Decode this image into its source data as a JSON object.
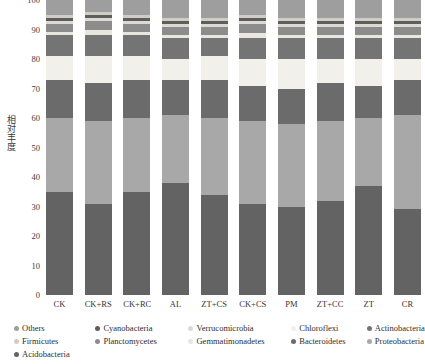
{
  "chart_data": {
    "type": "bar",
    "subtype": "stacked-bar-100-percent",
    "title": "",
    "xlabel": "",
    "ylabel": "相对丰度",
    "ylim": [
      0,
      100
    ],
    "yticks": [
      0,
      10,
      20,
      30,
      40,
      50,
      60,
      70,
      80,
      90,
      100
    ],
    "grid": false,
    "legend_position": "bottom",
    "categories": [
      "CK",
      "CK+RS",
      "CK+RC",
      "AL",
      "ZT+CS",
      "CK+CS",
      "PM",
      "ZT+CC",
      "ZT",
      "CR"
    ],
    "series": [
      {
        "name": "Proteobacteria",
        "color": "#636363",
        "values": [
          35,
          31,
          35,
          38,
          34,
          31,
          30,
          32,
          37,
          29
        ]
      },
      {
        "name": "Acidobacteria",
        "color": "#a8a8a8",
        "values": [
          25,
          28,
          25,
          23,
          26,
          28,
          28,
          27,
          23,
          32
        ]
      },
      {
        "name": "Bacteroidetes",
        "color": "#6b6b6b",
        "values": [
          13,
          13,
          13,
          12,
          13,
          12,
          12,
          13,
          11,
          12
        ]
      },
      {
        "name": "Chloroflexi",
        "color": "#f2f0ea",
        "values": [
          8,
          9,
          8,
          7,
          8,
          9,
          10,
          8,
          9,
          7
        ]
      },
      {
        "name": "Actinobacteria",
        "color": "#747474",
        "values": [
          7,
          7,
          7,
          7,
          6,
          7,
          7,
          7,
          7,
          7
        ]
      },
      {
        "name": "Gemmatimonadetes",
        "color": "#e8e6df",
        "values": [
          1,
          2,
          1,
          1,
          1,
          2,
          1,
          1,
          1,
          1
        ]
      },
      {
        "name": "Planctomycetes",
        "color": "#8c8c8c",
        "values": [
          3,
          3,
          3,
          3,
          3,
          3,
          3,
          3,
          3,
          3
        ]
      },
      {
        "name": "Verrucomicrobia",
        "color": "#dcdad3",
        "values": [
          1,
          1,
          1,
          1,
          1,
          1,
          1,
          1,
          1,
          1
        ]
      },
      {
        "name": "Cyanobacteria",
        "color": "#5e5e5e",
        "values": [
          1,
          1,
          1,
          1,
          1,
          1,
          1,
          1,
          1,
          1
        ]
      },
      {
        "name": "Firmicutes",
        "color": "#cfcdc6",
        "values": [
          1,
          1,
          1,
          1,
          1,
          1,
          1,
          1,
          1,
          1
        ]
      },
      {
        "name": "Others",
        "color": "#9e9e9e",
        "values": [
          5,
          4,
          5,
          6,
          6,
          5,
          6,
          6,
          6,
          6
        ]
      }
    ]
  },
  "legend": {
    "rows": [
      [
        {
          "label": "Others",
          "color": "#9e9e9e"
        },
        {
          "label": "Cyanobacteria",
          "color": "#5e5e5e"
        },
        {
          "label": "Verrucomicrobia",
          "color": "#dcdad3"
        },
        {
          "label": "Chloroflexi",
          "color": "#f2f0ea"
        },
        {
          "label": "Actinobacteria",
          "color": "#747474"
        }
      ],
      [
        {
          "label": "Firmicutes",
          "color": "#cfcdc6"
        },
        {
          "label": "Planctomycetes",
          "color": "#8c8c8c"
        },
        {
          "label": "Gemmatimonadetes",
          "color": "#e8e6df"
        },
        {
          "label": "Bacteroidetes",
          "color": "#6b6b6b"
        },
        {
          "label": "Proteobacteria",
          "color": "#a8a8a8"
        }
      ],
      [
        {
          "label": "Acidobacteria",
          "color": "#636363"
        }
      ]
    ]
  }
}
